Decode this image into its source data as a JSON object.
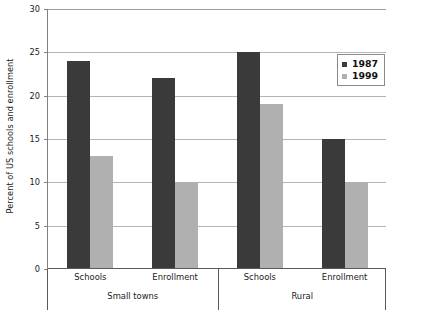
{
  "chart_data": {
    "type": "bar",
    "title": "",
    "xlabel": "",
    "ylabel": "Percent of US schools and enrollment",
    "ylim": [
      0,
      30
    ],
    "yticks": [
      0,
      5,
      10,
      15,
      20,
      25,
      30
    ],
    "ytick_labels": [
      "0",
      "5",
      "10",
      "15",
      "20",
      "25",
      "30"
    ],
    "grid": true,
    "legend_position": "upper right",
    "group_labels": [
      "Small towns",
      "Rural"
    ],
    "categories": [
      "Schools",
      "Enrollment",
      "Schools",
      "Enrollment"
    ],
    "series": [
      {
        "name": "1987",
        "color": "#3a3a3a",
        "values": [
          24,
          22,
          25,
          15
        ]
      },
      {
        "name": "1999",
        "color": "#b0b0b0",
        "values": [
          13,
          10,
          19,
          10
        ]
      }
    ],
    "groups": [
      {
        "label": "Small towns",
        "categories": [
          {
            "label": "Schools",
            "1987": 24,
            "1999": 13
          },
          {
            "label": "Enrollment",
            "1987": 22,
            "1999": 10
          }
        ]
      },
      {
        "label": "Rural",
        "categories": [
          {
            "label": "Schools",
            "1987": 25,
            "1999": 19
          },
          {
            "label": "Enrollment",
            "1987": 15,
            "1999": 10
          }
        ]
      }
    ]
  },
  "legend": {
    "entries": [
      {
        "label": "1987",
        "color": "#3a3a3a",
        "swatch_name": "legend-swatch-1987"
      },
      {
        "label": "1999",
        "color": "#b0b0b0",
        "swatch_name": "legend-swatch-1999"
      }
    ]
  },
  "axis": {
    "y_title": "Percent of US schools and enrollment",
    "y_ticks": [
      "30",
      "25",
      "20",
      "15",
      "10",
      "5",
      "0"
    ]
  },
  "colors": {
    "series_1987": "#3a3a3a",
    "series_1999": "#b0b0b0",
    "gridline": "#b5b5b5",
    "axis": "#5a5a5a",
    "background": "#ffffff",
    "text": "#1a1a1a"
  }
}
